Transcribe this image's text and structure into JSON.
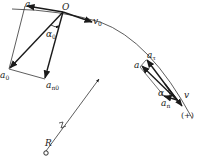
{
  "figure": {
    "type": "kinematics-acceleration-decomposition",
    "colors": {
      "ink": "#1a1a1a",
      "thin": "#333333",
      "background": "#ffffff"
    },
    "labels": {
      "origin_point": "O",
      "initial_velocity": {
        "base": "v",
        "sub": "0"
      },
      "initial_tangential_accel": {
        "base": "a",
        "sub": "τ"
      },
      "initial_total_accel": {
        "base": "a",
        "sub": "0"
      },
      "initial_normal_accel": {
        "base": "a",
        "sub": "n0"
      },
      "initial_angle": {
        "base": "α",
        "sub": "0"
      },
      "radius": "R",
      "point_accel": "a",
      "point_tangential_accel": {
        "base": "a",
        "sub": "τ"
      },
      "point_normal_accel": {
        "base": "a",
        "sub": "n"
      },
      "point_angle": "α",
      "point_velocity": "v",
      "positive_direction": "(+)"
    }
  }
}
